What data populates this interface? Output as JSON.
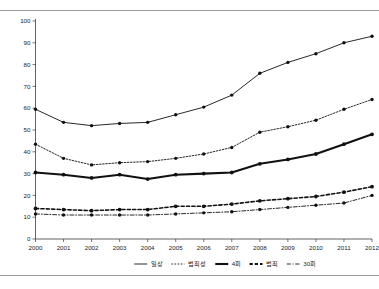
{
  "chart_data": {
    "type": "line",
    "title": "",
    "subtitle": "",
    "xlabel": "",
    "ylabel": "",
    "xlim": [
      2000,
      2012
    ],
    "ylim": [
      0,
      100
    ],
    "ytick_step": 10,
    "grid": false,
    "legend_position": "bottom",
    "categories": [
      "2000",
      "2001",
      "2002",
      "2003",
      "2004",
      "2005",
      "2006",
      "2007",
      "2008",
      "2009",
      "2010",
      "2011",
      "2012"
    ],
    "x": [
      2000,
      2001,
      2002,
      2003,
      2004,
      2005,
      2006,
      2007,
      2008,
      2009,
      2010,
      2011,
      2012
    ],
    "yticks": [
      0,
      10,
      20,
      30,
      40,
      50,
      60,
      70,
      80,
      90,
      100
    ],
    "ytick_labels": [
      "0",
      "10",
      "20",
      "30",
      "40",
      "50",
      "60",
      "70",
      "80",
      "90",
      "100"
    ],
    "series": [
      {
        "name": "일상",
        "style": "solid",
        "width": 0.9,
        "marker": "circle",
        "color": "#111111",
        "values": [
          59.5,
          53.5,
          52.0,
          53.0,
          53.5,
          57.0,
          60.5,
          66.0,
          76.0,
          81.0,
          85.0,
          90.0,
          93.0
        ]
      },
      {
        "name": "범죄성",
        "style": "dotted",
        "width": 0.9,
        "marker": "circle",
        "color": "#111111",
        "values": [
          43.5,
          37.0,
          34.0,
          35.0,
          35.5,
          37.0,
          39.0,
          42.0,
          49.0,
          51.5,
          54.5,
          59.5,
          64.0
        ]
      },
      {
        "name": "4회",
        "style": "solid",
        "width": 2.1,
        "marker": "circle",
        "color": "#111111",
        "values": [
          30.5,
          29.5,
          28.0,
          29.5,
          27.5,
          29.5,
          30.0,
          30.5,
          34.5,
          36.5,
          39.0,
          43.5,
          48.0
        ]
      },
      {
        "name": "범죄",
        "style": "dashed",
        "width": 1.6,
        "marker": "circle",
        "color": "#111111",
        "values": [
          14.0,
          13.5,
          13.0,
          13.5,
          13.5,
          15.0,
          15.0,
          16.0,
          17.5,
          18.5,
          19.5,
          21.5,
          24.0
        ]
      },
      {
        "name": "30회",
        "style": "dashdot",
        "width": 0.9,
        "marker": "circle",
        "color": "#111111",
        "values": [
          11.5,
          11.0,
          11.0,
          11.0,
          11.0,
          11.5,
          12.0,
          12.5,
          13.5,
          14.5,
          15.5,
          16.5,
          20.0
        ]
      }
    ]
  },
  "legend": {
    "items": [
      {
        "label": "일상",
        "style": "solid"
      },
      {
        "label": "범죄성",
        "style": "dotted"
      },
      {
        "label": "4회",
        "style": "solid-thick"
      },
      {
        "label": "범죄",
        "style": "dashed-thick"
      },
      {
        "label": "30회",
        "style": "dashdot"
      }
    ]
  }
}
